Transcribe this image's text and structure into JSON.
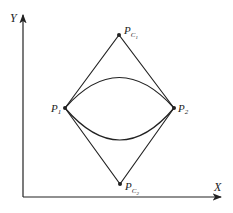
{
  "axes": {
    "x_label": "X",
    "y_label": "Y"
  },
  "points": {
    "pc1": {
      "label": "P",
      "sub": "C",
      "subsub": "1"
    },
    "p1": {
      "label": "P",
      "sub": "1"
    },
    "p2": {
      "label": "P",
      "sub": "2"
    },
    "pc2": {
      "label": "P",
      "sub": "C",
      "subsub": "2"
    }
  },
  "colors": {
    "stroke": "#222222",
    "background": "#ffffff"
  }
}
